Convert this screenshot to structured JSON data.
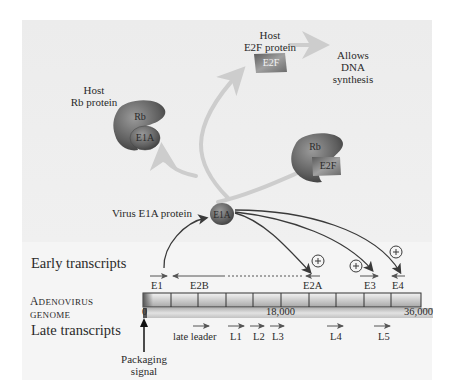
{
  "figure": {
    "top_section": {
      "host_rb_protein": {
        "line1": "Host",
        "line2": "Rb protein",
        "shape_label_top": "Rb",
        "shape_label_bottom": "E1A"
      },
      "host_e2f_protein": {
        "line1": "Host",
        "line2": "E2F protein",
        "shape_label": "E2F"
      },
      "allows_dna_synthesis": {
        "line1": "Allows",
        "line2": "DNA",
        "line3": "synthesis"
      },
      "rb_e2f_complex": {
        "shape_label_top": "Rb",
        "shape_label_bottom": "E2F"
      },
      "virus_e1a_protein": {
        "label": "Virus E1A protein",
        "shape_label": "E1A"
      }
    },
    "bottom_section": {
      "early_transcripts_label": "Early transcripts",
      "genome_label": {
        "line1_cap": "A",
        "line1_rest": "DENOVIRUS",
        "line2": "GENOME"
      },
      "late_transcripts_label": "Late transcripts",
      "early_transcripts": [
        {
          "name": "E1",
          "direction": "right"
        },
        {
          "name": "E2B",
          "direction": "left"
        },
        {
          "name": "E2A",
          "direction": "left"
        },
        {
          "name": "E3",
          "direction": "right"
        },
        {
          "name": "E4",
          "direction": "left"
        }
      ],
      "activation_symbol": "+",
      "genome_ticks": {
        "start": "0",
        "mid": "18,000",
        "end": "36,000"
      },
      "late_transcripts": [
        {
          "name": "late leader"
        },
        {
          "name": "L1"
        },
        {
          "name": "L2"
        },
        {
          "name": "L3"
        },
        {
          "name": "L4"
        },
        {
          "name": "L5"
        }
      ],
      "packaging_signal": {
        "line1": "Packaging",
        "line2": "signal"
      }
    },
    "colors": {
      "protein_gray": "#6e6e6e",
      "arrow_dark": "#3a3a3a",
      "arrow_light": "#c9c9c9",
      "panel_top": "#ececec",
      "panel_bottom": "#f5f5f5"
    }
  }
}
